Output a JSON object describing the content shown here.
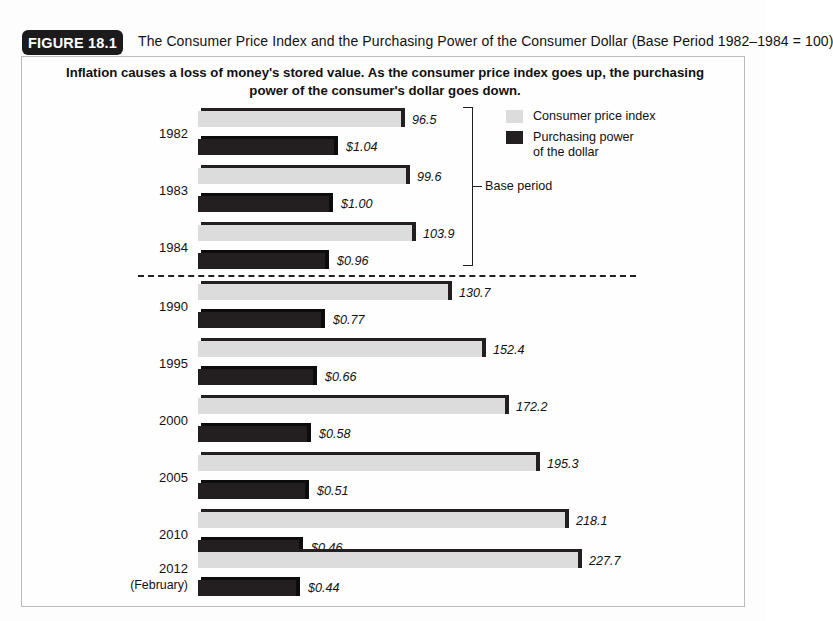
{
  "figure": {
    "badge": "FIGURE 18.1",
    "title": "The Consumer Price Index and the Purchasing Power of the Consumer Dollar (Base Period 1982–1984 = 100)",
    "subtitle": "Inflation causes a loss of money's stored value. As the consumer price index goes up, the purchasing power of the consumer's dollar goes down."
  },
  "legend": {
    "items": [
      {
        "label": "Consumer price index",
        "color": "#dcdcdc"
      },
      {
        "label": "Purchasing power\nof the dollar",
        "line1": "Purchasing power",
        "line2": "of the dollar",
        "color": "#231f20"
      }
    ]
  },
  "annotations": {
    "base_period_label": "Base period"
  },
  "chart_data": {
    "type": "bar",
    "orientation": "horizontal",
    "title": "The Consumer Price Index and the Purchasing Power of the Consumer Dollar (Base Period 1982–1984 = 100)",
    "subtitle": "Inflation causes a loss of money's stored value. As the consumer price index goes up, the purchasing power of the consumer's dollar goes down.",
    "xlabel": "",
    "ylabel": "",
    "grid": false,
    "legend_position": "top-right",
    "categories": [
      "1982",
      "1983",
      "1984",
      "1990",
      "1995",
      "2000",
      "2005",
      "2010",
      "2012"
    ],
    "category_sublabels": [
      "",
      "",
      "",
      "",
      "",
      "",
      "",
      "",
      "(February)"
    ],
    "series": [
      {
        "name": "Consumer price index",
        "color": "#dcdcdc",
        "values": [
          96.5,
          99.6,
          103.9,
          130.7,
          152.4,
          172.2,
          195.3,
          218.1,
          227.7
        ],
        "value_labels": [
          "96.5",
          "99.6",
          "103.9",
          "130.7",
          "152.4",
          "172.2",
          "195.3",
          "218.1",
          "227.7"
        ]
      },
      {
        "name": "Purchasing power of the dollar",
        "color": "#231f20",
        "values": [
          1.04,
          1.0,
          0.96,
          0.77,
          0.66,
          0.58,
          0.51,
          0.46,
          0.44
        ],
        "value_labels": [
          "$1.04",
          "$1.00",
          "$0.96",
          "$0.77",
          "$0.66",
          "$0.58",
          "$0.51",
          "$0.46",
          "$0.44"
        ]
      }
    ],
    "annotations": [
      {
        "text": "Base period",
        "covers": [
          "1982",
          "1983",
          "1984"
        ]
      },
      {
        "text": "dashed separator",
        "after": "1984"
      }
    ]
  },
  "rows": [
    {
      "year": "1982",
      "sub": "",
      "cpi": "96.5",
      "cpi_w": 207,
      "dol": "$1.04",
      "dol_w": 140,
      "y": 108
    },
    {
      "year": "1983",
      "sub": "",
      "cpi": "99.6",
      "cpi_w": 212,
      "dol": "$1.00",
      "dol_w": 135,
      "y": 165
    },
    {
      "year": "1984",
      "sub": "",
      "cpi": "103.9",
      "cpi_w": 218,
      "dol": "$0.96",
      "dol_w": 131,
      "y": 222
    },
    {
      "year": "1990",
      "sub": "",
      "cpi": "130.7",
      "cpi_w": 254,
      "dol": "$0.77",
      "dol_w": 127,
      "y": 281
    },
    {
      "year": "1995",
      "sub": "",
      "cpi": "152.4",
      "cpi_w": 288,
      "dol": "$0.66",
      "dol_w": 119,
      "y": 338
    },
    {
      "year": "2000",
      "sub": "",
      "cpi": "172.2",
      "cpi_w": 311,
      "dol": "$0.58",
      "dol_w": 113,
      "y": 395
    },
    {
      "year": "2005",
      "sub": "",
      "cpi": "195.3",
      "cpi_w": 342,
      "dol": "$0.51",
      "dol_w": 111,
      "y": 452
    },
    {
      "year": "2010",
      "sub": "",
      "cpi": "218.1",
      "cpi_w": 371,
      "dol": "$0.46",
      "dol_w": 105,
      "y": 509
    },
    {
      "year": "2012",
      "sub": "(February)",
      "cpi": "227.7",
      "cpi_w": 384,
      "dol": "$0.44",
      "dol_w": 102,
      "y": 549
    }
  ]
}
